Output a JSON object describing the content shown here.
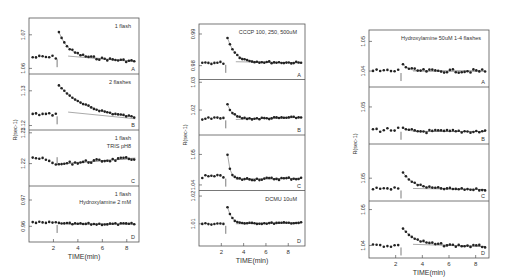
{
  "figure": {
    "background": "#ffffff",
    "ink": "#222222",
    "line": "#555555"
  },
  "chart_data": [
    {
      "type": "scatter",
      "id": "col1",
      "frame": {
        "x": 29,
        "y": 18,
        "w": 110,
        "h": 224
      },
      "xlabel": "TIME(min)",
      "ylabel": "R(sec-1)",
      "xlim": [
        0,
        9
      ],
      "xticks": [
        2,
        4,
        6,
        8
      ],
      "flash_time": 2.3,
      "panels": [
        {
          "letter": "A",
          "label_lines": [
            "1 flash"
          ],
          "yticks": [
            {
              "label": "1.07",
              "pos": 0.3
            },
            {
              "label": "1.06",
              "pos": 0.9
            }
          ],
          "baseline": 0.7,
          "peak": 0.25,
          "decay": 0.8,
          "settle": 0.68,
          "noise": 0.04,
          "drift_end": 0.78
        },
        {
          "letter": "B",
          "label_lines": [
            "2 flashes"
          ],
          "yticks": [
            {
              "label": "1.13",
              "pos": 0.3
            },
            {
              "label": "1.12",
              "pos": 0.92
            }
          ],
          "baseline": 0.72,
          "peak": 0.2,
          "decay": 2.0,
          "settle": 0.68,
          "noise": 0.03,
          "drift_end": 0.8
        },
        {
          "letter": "C",
          "label_lines": [
            "1 flash",
            "TRIS pH8"
          ],
          "yticks": [
            {
              "label": "1.23",
              "pos": 0.05
            },
            {
              "label": "1.22",
              "pos": 0.6
            }
          ],
          "baseline": 0.45,
          "peak": 0.62,
          "decay": 0.6,
          "settle": 0.6,
          "noise": 0.05,
          "drift_end": 0.5,
          "pre_trend": true
        },
        {
          "letter": "D",
          "label_lines": [
            "1 flash",
            "Hydroxylamine  2 mM"
          ],
          "yticks": [
            {
              "label": "0.97",
              "pos": 0.25
            },
            {
              "label": "0.96",
              "pos": 0.72
            }
          ],
          "baseline": 0.66,
          "peak": 0.66,
          "decay": 0.5,
          "settle": 0.68,
          "noise": 0.03,
          "drift_end": 0.68
        }
      ]
    },
    {
      "type": "scatter",
      "id": "col2",
      "frame": {
        "x": 199,
        "y": 24,
        "w": 106,
        "h": 222
      },
      "xlabel": "TIME(min)",
      "ylabel": "R(sec-1)",
      "xlim": [
        0,
        9.5
      ],
      "xticks": [
        2,
        4,
        6,
        8
      ],
      "flash_time": 2.4,
      "panels": [
        {
          "letter": "A",
          "label_lines": [
            "CCCP  100, 250, 500uM"
          ],
          "yticks": [
            {
              "label": "0.99",
              "pos": 0.18
            },
            {
              "label": "0.98",
              "pos": 0.75
            }
          ],
          "baseline": 0.7,
          "peak": 0.25,
          "decay": 0.7,
          "settle": 0.68,
          "noise": 0.03,
          "drift_end": 0.7
        },
        {
          "letter": "B",
          "label_lines": [],
          "yticks": [
            {
              "label": "1.03",
              "pos": 0.05
            },
            {
              "label": "1.02",
              "pos": 0.55
            }
          ],
          "baseline": 0.7,
          "peak": 0.45,
          "decay": 0.5,
          "settle": 0.72,
          "noise": 0.03,
          "drift_end": 0.68
        },
        {
          "letter": "C",
          "label_lines": [],
          "yticks": [
            {
              "label": "1.05",
              "pos": 0.35
            },
            {
              "label": "1.04",
              "pos": 0.9
            }
          ],
          "baseline": 0.75,
          "peak": 0.35,
          "decay": 0.25,
          "settle": 0.8,
          "noise": 0.04,
          "drift_end": 0.78
        },
        {
          "letter": "D",
          "label_lines": [
            "DCMU 10uM"
          ],
          "yticks": [
            {
              "label": "1.02",
              "pos": 0.1
            },
            {
              "label": "1.01",
              "pos": 0.6
            }
          ],
          "baseline": 0.6,
          "peak": 0.3,
          "decay": 0.4,
          "settle": 0.6,
          "noise": 0.02,
          "drift_end": 0.58
        }
      ]
    },
    {
      "type": "scatter",
      "id": "col3",
      "frame": {
        "x": 369,
        "y": 30,
        "w": 120,
        "h": 228
      },
      "xlabel": "TIME(min)",
      "ylabel": "R(sec-1)",
      "xlim": [
        0,
        9
      ],
      "xticks": [
        2,
        4,
        6,
        8
      ],
      "flash_time": 2.4,
      "title": "Hydroxylamine 50uM  1-4 flashes",
      "panels": [
        {
          "letter": "A",
          "label_lines": [
            "Hydroxylamine 50uM  1-4 flashes"
          ],
          "yticks": [
            {
              "label": "1.05",
              "pos": 0.2
            },
            {
              "label": "1.04",
              "pos": 0.72
            }
          ],
          "baseline": 0.72,
          "peak": 0.6,
          "decay": 0.4,
          "settle": 0.72,
          "noise": 0.05,
          "drift_end": 0.72
        },
        {
          "letter": "B",
          "label_lines": [],
          "yticks": [
            {
              "label": "1.05",
              "pos": 0.35
            },
            {
              "label": "1.05",
              "pos": 0.35
            }
          ],
          "baseline": 0.75,
          "peak": 0.72,
          "decay": 0.4,
          "settle": 0.78,
          "noise": 0.05,
          "drift_end": 0.78
        },
        {
          "letter": "C",
          "label_lines": [],
          "yticks": [
            {
              "label": "1.05",
              "pos": 0.6
            }
          ],
          "baseline": 0.78,
          "peak": 0.5,
          "decay": 0.8,
          "settle": 0.78,
          "noise": 0.03,
          "drift_end": 0.8
        },
        {
          "letter": "D",
          "label_lines": [],
          "yticks": [
            {
              "label": "1.05",
              "pos": 0.15
            },
            {
              "label": "1.04",
              "pos": 0.78
            }
          ],
          "baseline": 0.78,
          "peak": 0.48,
          "decay": 0.9,
          "settle": 0.76,
          "noise": 0.04,
          "drift_end": 0.8
        }
      ]
    }
  ]
}
